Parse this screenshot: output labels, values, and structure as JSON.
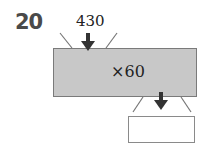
{
  "problem": {
    "number": "20",
    "input_value": "430",
    "operation": "×60",
    "output_value": ""
  }
}
